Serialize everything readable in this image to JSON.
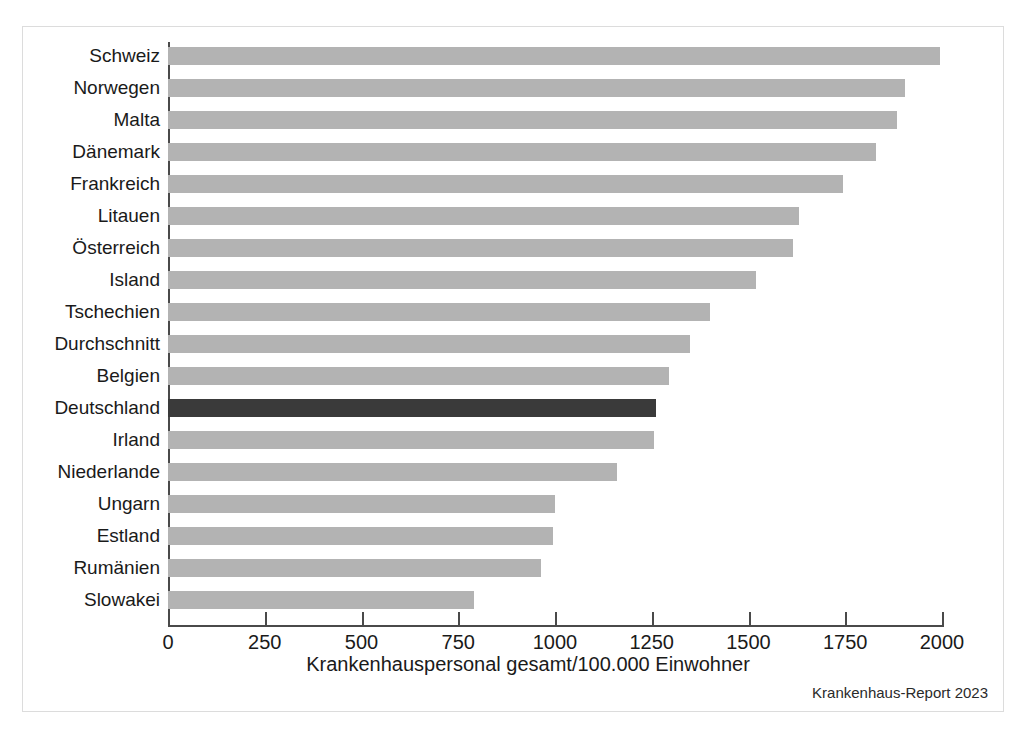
{
  "figure": {
    "source_note": "Krankenhaus-Report 2023",
    "bar_color": "#b3b3b3",
    "highlight_color": "#3a3a3a",
    "axis_color": "#4a4a4a",
    "frame_color": "#dcdcdc"
  },
  "chart_data": {
    "type": "bar",
    "orientation": "horizontal",
    "title": "",
    "xlabel": "Krankenhauspersonal gesamt/100.000 Einwohner",
    "ylabel": "",
    "xlim": [
      0,
      2000
    ],
    "xticks": [
      0,
      250,
      500,
      750,
      1000,
      1250,
      1500,
      1750,
      2000
    ],
    "xtick_labels": [
      "0",
      "250",
      "500",
      "750",
      "1000",
      "1250",
      "1500",
      "1750",
      "2000"
    ],
    "grid": false,
    "legend": false,
    "highlight_category": "Deutschland",
    "categories": [
      "Schweiz",
      "Norwegen",
      "Malta",
      "Dänemark",
      "Frankreich",
      "Litauen",
      "Österreich",
      "Island",
      "Tschechien",
      "Durchschnitt",
      "Belgien",
      "Deutschland",
      "Irland",
      "Niederlande",
      "Ungarn",
      "Estland",
      "Rumänien",
      "Slowakei"
    ],
    "values": [
      1995,
      1905,
      1885,
      1830,
      1745,
      1630,
      1615,
      1520,
      1400,
      1350,
      1295,
      1260,
      1255,
      1160,
      1000,
      995,
      965,
      790
    ]
  }
}
